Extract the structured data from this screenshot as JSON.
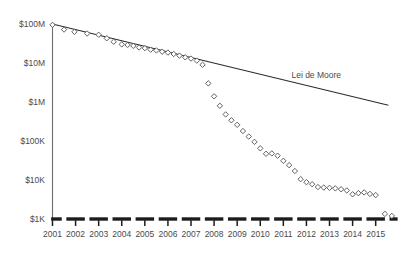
{
  "chart_data": {
    "type": "scatter",
    "title": "",
    "subtitle": "",
    "xlabel": "",
    "ylabel": "",
    "yscale": "log",
    "ylim": [
      1000,
      100000000
    ],
    "xlim": [
      2001,
      2015.75
    ],
    "grid": false,
    "legend_position": "inline-annotation",
    "ytick_labels": [
      "$100M",
      "$10M",
      "$1M",
      "$100K",
      "$10K",
      "$1K"
    ],
    "ytick_values": [
      100000000,
      10000000,
      1000000,
      100000,
      10000,
      1000
    ],
    "xtick_labels": [
      "2001",
      "2002",
      "2003",
      "2004",
      "2005",
      "2006",
      "2007",
      "2008",
      "2009",
      "2010",
      "2011",
      "2012",
      "2013",
      "2014",
      "2015"
    ],
    "xtick_values": [
      2001,
      2002,
      2003,
      2004,
      2005,
      2006,
      2007,
      2008,
      2009,
      2010,
      2011,
      2012,
      2013,
      2014,
      2015
    ],
    "annotations": [
      {
        "text": "Lei de Moore",
        "x": 2011.35,
        "y": 4200000
      }
    ],
    "series": [
      {
        "name": "Lei de Moore",
        "type": "line",
        "color": "#2b2b2b",
        "points": [
          {
            "x": 2001.0,
            "y": 100000000
          },
          {
            "x": 2015.55,
            "y": 830000
          }
        ]
      },
      {
        "name": "Cost per genome",
        "type": "scatter",
        "marker": "diamond",
        "color": "#5a5a5a",
        "points": [
          {
            "x": 2001.0,
            "y": 95000000
          },
          {
            "x": 2001.5,
            "y": 72000000
          },
          {
            "x": 2001.95,
            "y": 63000000
          },
          {
            "x": 2002.5,
            "y": 57000000
          },
          {
            "x": 2003.0,
            "y": 53000000
          },
          {
            "x": 2003.35,
            "y": 43000000
          },
          {
            "x": 2003.65,
            "y": 35000000
          },
          {
            "x": 2004.0,
            "y": 30000000
          },
          {
            "x": 2004.25,
            "y": 29000000
          },
          {
            "x": 2004.5,
            "y": 27500000
          },
          {
            "x": 2004.75,
            "y": 25000000
          },
          {
            "x": 2005.0,
            "y": 24000000
          },
          {
            "x": 2005.25,
            "y": 22000000
          },
          {
            "x": 2005.5,
            "y": 21000000
          },
          {
            "x": 2005.75,
            "y": 19500000
          },
          {
            "x": 2006.0,
            "y": 18500000
          },
          {
            "x": 2006.25,
            "y": 17000000
          },
          {
            "x": 2006.5,
            "y": 15500000
          },
          {
            "x": 2006.75,
            "y": 14000000
          },
          {
            "x": 2007.0,
            "y": 13000000
          },
          {
            "x": 2007.25,
            "y": 11500000
          },
          {
            "x": 2007.5,
            "y": 9000000
          },
          {
            "x": 2007.75,
            "y": 3000000
          },
          {
            "x": 2008.0,
            "y": 1400000
          },
          {
            "x": 2008.25,
            "y": 800000
          },
          {
            "x": 2008.5,
            "y": 480000
          },
          {
            "x": 2008.75,
            "y": 340000
          },
          {
            "x": 2009.0,
            "y": 260000
          },
          {
            "x": 2009.25,
            "y": 180000
          },
          {
            "x": 2009.5,
            "y": 130000
          },
          {
            "x": 2009.75,
            "y": 95000
          },
          {
            "x": 2010.0,
            "y": 65000
          },
          {
            "x": 2010.25,
            "y": 47000
          },
          {
            "x": 2010.5,
            "y": 48000
          },
          {
            "x": 2010.75,
            "y": 42000
          },
          {
            "x": 2011.0,
            "y": 31000
          },
          {
            "x": 2011.25,
            "y": 24000
          },
          {
            "x": 2011.5,
            "y": 17000
          },
          {
            "x": 2011.75,
            "y": 10500
          },
          {
            "x": 2012.0,
            "y": 8800
          },
          {
            "x": 2012.25,
            "y": 7800
          },
          {
            "x": 2012.5,
            "y": 6600
          },
          {
            "x": 2012.75,
            "y": 6400
          },
          {
            "x": 2013.0,
            "y": 6300
          },
          {
            "x": 2013.25,
            "y": 6100
          },
          {
            "x": 2013.5,
            "y": 5800
          },
          {
            "x": 2013.75,
            "y": 5400
          },
          {
            "x": 2014.0,
            "y": 4300
          },
          {
            "x": 2014.25,
            "y": 4600
          },
          {
            "x": 2014.5,
            "y": 4800
          },
          {
            "x": 2014.75,
            "y": 4400
          },
          {
            "x": 2015.0,
            "y": 4100
          },
          {
            "x": 2015.4,
            "y": 1350
          },
          {
            "x": 2015.7,
            "y": 1200
          }
        ]
      }
    ]
  }
}
